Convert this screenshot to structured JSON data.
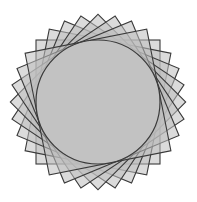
{
  "figure": {
    "center": [
      98,
      102
    ],
    "square_side": 124,
    "square_count": 8,
    "rotation_step_deg": 11.25,
    "circle_radius": 62,
    "colors": {
      "fill": "#bdbdbd",
      "stroke": "#3a3a3a",
      "circle_fill": "#c2c2c2",
      "background": "#ffffff"
    }
  }
}
